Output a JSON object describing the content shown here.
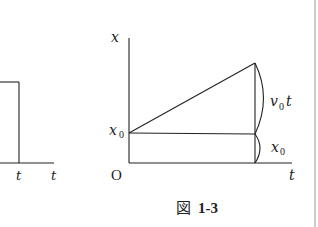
{
  "left_figure": {
    "labels": {
      "t_mark": "t",
      "t_axis": "t"
    }
  },
  "right_figure": {
    "axis_labels": {
      "y_axis": "x",
      "x_axis": "t",
      "origin": "O",
      "x0_tick_base": "x",
      "x0_tick_sub": "0"
    },
    "brace_labels": {
      "upper_base": "v",
      "upper_sub": "0",
      "upper_tail": "t",
      "lower_base": "x",
      "lower_sub": "0"
    }
  },
  "caption": {
    "prefix": "図",
    "number": "1-3"
  }
}
